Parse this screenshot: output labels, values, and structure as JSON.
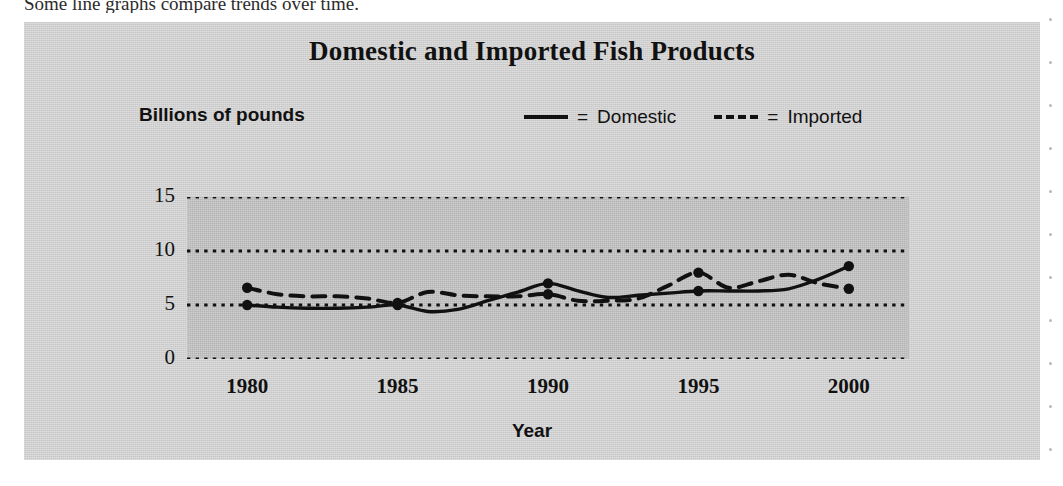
{
  "intro": {
    "sentence": "Some line graphs compare trends over time."
  },
  "figure": {
    "title": "Domestic and Imported Fish Products",
    "y_axis_title": "Billions of pounds",
    "x_axis_title": "Year",
    "legend": [
      {
        "marker": "solid-line",
        "equals": "=",
        "label": "Domestic"
      },
      {
        "marker": "dashed-line",
        "equals": "=",
        "label": "Imported"
      }
    ]
  },
  "chart_data": {
    "type": "line",
    "title": "Domestic and Imported Fish Products",
    "xlabel": "Year",
    "ylabel": "Billions of pounds",
    "xlim": [
      1978,
      2002
    ],
    "ylim": [
      0,
      15
    ],
    "yticks": [
      0,
      5,
      10,
      15
    ],
    "xticks": [
      1980,
      1985,
      1990,
      1995,
      2000
    ],
    "grid": "horizontal-dotted",
    "legend_position": "top-right",
    "series": [
      {
        "name": "Domestic",
        "style": "solid",
        "markers_at": [
          1980,
          1985,
          1990,
          1995,
          2000
        ],
        "x": [
          1980,
          1981,
          1982,
          1983,
          1984,
          1985,
          1986,
          1987,
          1988,
          1989,
          1990,
          1991,
          1992,
          1993,
          1994,
          1995,
          1996,
          1997,
          1998,
          1999,
          2000
        ],
        "values": [
          5.0,
          4.8,
          4.7,
          4.7,
          4.8,
          5.0,
          4.4,
          4.6,
          5.4,
          6.2,
          7.0,
          6.3,
          5.7,
          5.9,
          6.1,
          6.3,
          6.3,
          6.3,
          6.5,
          7.4,
          8.6
        ]
      },
      {
        "name": "Imported",
        "style": "dashed",
        "markers_at": [
          1980,
          1985,
          1990,
          1995,
          2000
        ],
        "x": [
          1980,
          1981,
          1982,
          1983,
          1984,
          1985,
          1986,
          1987,
          1988,
          1989,
          1990,
          1991,
          1992,
          1993,
          1994,
          1995,
          1996,
          1997,
          1998,
          1999,
          2000
        ],
        "values": [
          6.6,
          6.0,
          5.8,
          5.8,
          5.6,
          5.2,
          6.2,
          5.9,
          5.8,
          5.8,
          6.0,
          5.4,
          5.4,
          5.6,
          6.8,
          8.0,
          6.6,
          7.2,
          7.8,
          7.0,
          6.5
        ]
      }
    ]
  },
  "colors": {
    "panel_background": "#d2d2d2",
    "plot_background": "#c2c2c2",
    "ink": "#111111"
  }
}
